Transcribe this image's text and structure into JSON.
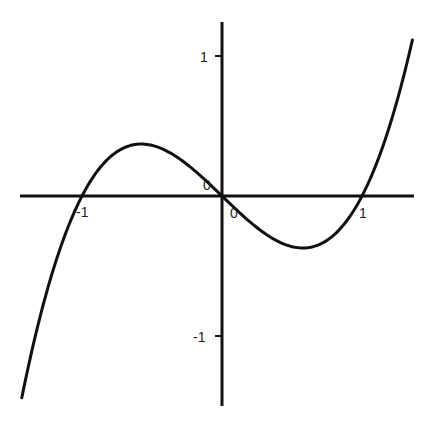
{
  "chart_data": {
    "type": "line",
    "title": "",
    "xlabel": "",
    "ylabel": "",
    "function": "y = x^3 - x",
    "xlim": [
      -1.43,
      1.36
    ],
    "ylim": [
      -1.5,
      1.3
    ],
    "grid": false,
    "legend": null,
    "x_ticks": [
      {
        "value": -1,
        "label": "-1"
      },
      {
        "value": 0,
        "label": "0"
      },
      {
        "value": 1,
        "label": "1"
      }
    ],
    "y_ticks": [
      {
        "value": 1,
        "label": "1"
      },
      {
        "value": -1,
        "label": "-1"
      }
    ],
    "origin_label": "0",
    "series": [
      {
        "name": "f(x)",
        "x": [
          -1.43,
          -1.25,
          -1.0,
          -0.75,
          -0.577,
          -0.4,
          -0.2,
          0.0,
          0.2,
          0.4,
          0.577,
          0.75,
          1.0,
          1.2,
          1.36
        ],
        "values": [
          -1.49,
          -0.7,
          0.0,
          0.33,
          0.385,
          0.336,
          0.192,
          0.0,
          -0.192,
          -0.336,
          -0.385,
          -0.33,
          0.0,
          0.528,
          1.155
        ]
      }
    ],
    "key_points": [
      {
        "label": "root",
        "x": -1,
        "y": 0
      },
      {
        "label": "root",
        "x": 0,
        "y": 0
      },
      {
        "label": "root",
        "x": 1,
        "y": 0
      },
      {
        "label": "local max",
        "x": -0.577,
        "y": 0.385
      },
      {
        "label": "local min",
        "x": 0.577,
        "y": -0.385
      }
    ]
  },
  "style": {
    "curve_color": "#111111",
    "axis_color": "#111111",
    "background": "#ffffff"
  }
}
